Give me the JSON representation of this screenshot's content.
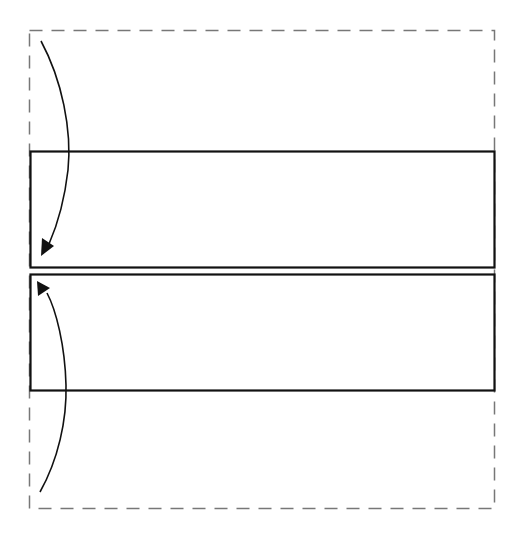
{
  "diagram": {
    "colors": {
      "background": "#ffffff",
      "solid_stroke": "#111111",
      "dashed_stroke": "#777777",
      "arrow": "#111111"
    },
    "outline": {
      "style": "dashed",
      "x": 29,
      "y": 30,
      "width": 465,
      "height": 478
    },
    "panels": [
      {
        "name": "upper-panel",
        "x": 30,
        "y": 151,
        "width": 464,
        "height": 116
      },
      {
        "name": "lower-panel",
        "x": 30,
        "y": 274,
        "width": 464,
        "height": 116
      }
    ],
    "arrows": [
      {
        "name": "fold-down-arrow",
        "direction": "down",
        "from": [
          41,
          41
        ],
        "to": [
          45,
          252
        ]
      },
      {
        "name": "fold-up-arrow",
        "direction": "up",
        "from": [
          40,
          492
        ],
        "to": [
          40,
          283
        ]
      }
    ]
  }
}
